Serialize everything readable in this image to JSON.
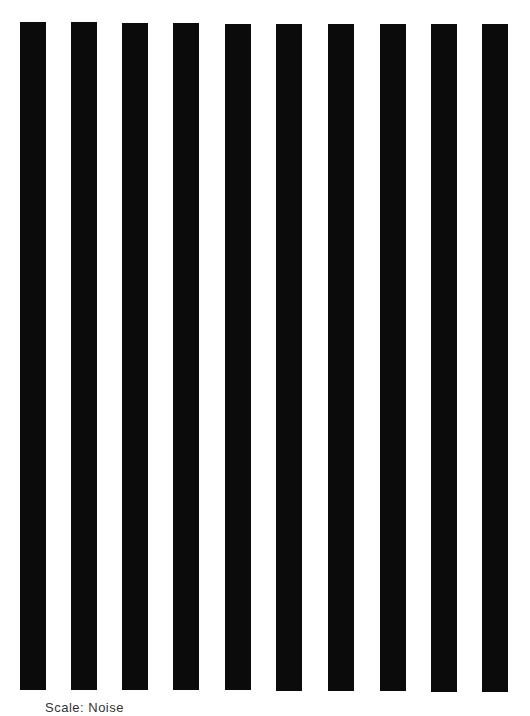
{
  "figure": {
    "background": "#ffffff",
    "bar_color": "#0b0b0b",
    "bars": [
      {
        "x": 20,
        "y": 22,
        "w": 26,
        "h": 668
      },
      {
        "x": 71,
        "y": 22,
        "w": 26,
        "h": 668
      },
      {
        "x": 122,
        "y": 23,
        "w": 26,
        "h": 667
      },
      {
        "x": 173,
        "y": 23,
        "w": 26,
        "h": 667
      },
      {
        "x": 225,
        "y": 24,
        "w": 26,
        "h": 666
      },
      {
        "x": 276,
        "y": 24,
        "w": 26,
        "h": 667
      },
      {
        "x": 328,
        "y": 24,
        "w": 26,
        "h": 667
      },
      {
        "x": 380,
        "y": 24,
        "w": 26,
        "h": 667
      },
      {
        "x": 431,
        "y": 24,
        "w": 26,
        "h": 668
      },
      {
        "x": 482,
        "y": 24,
        "w": 26,
        "h": 668
      }
    ],
    "caption": "Scale: Noise"
  }
}
